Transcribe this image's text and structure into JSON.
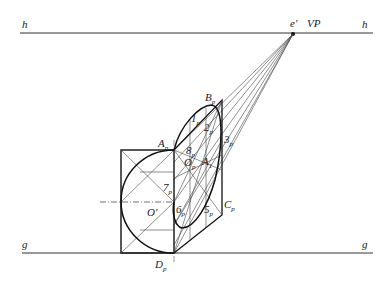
{
  "diagram": {
    "lines": {
      "horizon": {
        "label_left": "h",
        "label_right": "h"
      },
      "ground": {
        "label_left": "g",
        "label_right": "g"
      }
    },
    "vanishing_point": {
      "label": "e'",
      "name": "VP"
    },
    "labels": {
      "B": {
        "main": "B",
        "sub": "p"
      },
      "A": {
        "main": "A",
        "sub": "p"
      },
      "C": {
        "main": "C",
        "sub": "p"
      },
      "D": {
        "main": "D",
        "sub": "p"
      },
      "O": {
        "main": "O",
        "sub": "p"
      },
      "Oprime": "O'",
      "A1": {
        "main": "A",
        "sub": "1"
      },
      "p1": {
        "main": "1",
        "sub": "p"
      },
      "p2": {
        "main": "2",
        "sub": "p"
      },
      "p3": {
        "main": "3",
        "sub": "p"
      },
      "p5": {
        "main": "5",
        "sub": "p"
      },
      "p6": {
        "main": "6",
        "sub": "p"
      },
      "p7": {
        "main": "7",
        "sub": "p"
      },
      "p8": {
        "main": "8",
        "sub": "p"
      }
    }
  }
}
